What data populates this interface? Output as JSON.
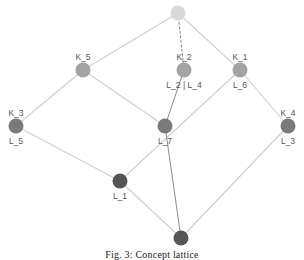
{
  "diagram": {
    "type": "concept-lattice",
    "nodes": [
      {
        "id": "top",
        "x": 178,
        "y": 13,
        "color": "#d9d9d9",
        "top_label": "",
        "bottom_label": ""
      },
      {
        "id": "k5",
        "x": 83,
        "y": 70,
        "color": "#a3a3a3",
        "top_label": "K_5",
        "bottom_label": ""
      },
      {
        "id": "k2",
        "x": 184,
        "y": 70,
        "color": "#a3a3a3",
        "top_label": "K_2",
        "bottom_label": "L_2 | L_4"
      },
      {
        "id": "k1",
        "x": 240,
        "y": 70,
        "color": "#a3a3a3",
        "top_label": "K_1",
        "bottom_label": "L_6"
      },
      {
        "id": "k3",
        "x": 16,
        "y": 126,
        "color": "#7a7a7a",
        "top_label": "K_3",
        "bottom_label": "L_5"
      },
      {
        "id": "l7",
        "x": 165,
        "y": 126,
        "color": "#7a7a7a",
        "top_label": "",
        "bottom_label": "L_7"
      },
      {
        "id": "k4",
        "x": 288,
        "y": 126,
        "color": "#7a7a7a",
        "top_label": "K_4",
        "bottom_label": "L_3"
      },
      {
        "id": "l1",
        "x": 120,
        "y": 181,
        "color": "#555555",
        "top_label": "",
        "bottom_label": "L_1"
      },
      {
        "id": "bottom",
        "x": 181,
        "y": 238,
        "color": "#555555",
        "top_label": "",
        "bottom_label": ""
      }
    ],
    "edges": [
      {
        "from": "top",
        "to": "k5",
        "style": "light"
      },
      {
        "from": "top",
        "to": "k2",
        "style": "dark-dashed"
      },
      {
        "from": "top",
        "to": "k1",
        "style": "light"
      },
      {
        "from": "k5",
        "to": "k3",
        "style": "light"
      },
      {
        "from": "k5",
        "to": "l7",
        "style": "light"
      },
      {
        "from": "k2",
        "to": "l7",
        "style": "dark"
      },
      {
        "from": "k1",
        "to": "l1",
        "style": "light"
      },
      {
        "from": "k1",
        "to": "k4",
        "style": "light"
      },
      {
        "from": "k3",
        "to": "l1",
        "style": "light"
      },
      {
        "from": "l1",
        "to": "bottom",
        "style": "light"
      },
      {
        "from": "l7",
        "to": "bottom",
        "style": "dark"
      },
      {
        "from": "k4",
        "to": "bottom",
        "style": "light"
      }
    ],
    "caption": "Fig. 3: Concept lattice"
  }
}
